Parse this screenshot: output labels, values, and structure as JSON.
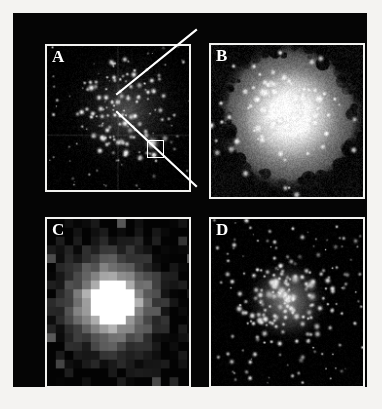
{
  "figure": {
    "kind": "multi-panel-astronomical-image",
    "page_background": "#f4f3f1",
    "mount_background": "#050505",
    "panel_border_color": "#f2f2f0",
    "label_color": "#ffffff",
    "panel_count": 4
  },
  "panels": [
    {
      "id": "a",
      "label": "A",
      "content": "wide-field star cluster",
      "background": "#000000",
      "star_color": "#ffffff",
      "haze_color": "#6a6a6a",
      "style": "starfield",
      "chip_gap": true,
      "star_count": 150,
      "seed": 101
    },
    {
      "id": "b",
      "label": "B",
      "content": "bright resolved nebulous core on mottled gray halo",
      "background": "#8d8d8d",
      "star_color": "#ffffff",
      "haze_color": "#d8d8d8",
      "style": "nebula-halo",
      "chip_gap": false,
      "star_count": 40,
      "seed": 202
    },
    {
      "id": "c",
      "label": "C",
      "content": "low-resolution pixelated blocky image of the core",
      "background": "#030303",
      "star_color": "#ffffff",
      "haze_color": "#808080",
      "style": "pixelated-blocks",
      "chip_gap": false,
      "block_size": 9,
      "seed": 303
    },
    {
      "id": "d",
      "label": "D",
      "content": "high-resolution image resolving individual point sources",
      "background": "#020202",
      "star_color": "#ffffff",
      "haze_color": "#9a9a9a",
      "style": "resolved-points",
      "chip_gap": false,
      "star_count": 130,
      "seed": 404
    }
  ],
  "zoom_box": {
    "name": "zoom-region-indicator",
    "color": "#ffffff",
    "x": 100,
    "y": 94,
    "width": 17,
    "height": 18
  },
  "leader_lines": {
    "name": "zoom-leader-lines",
    "color": "#ffffff",
    "width": 2.2,
    "segments": [
      {
        "from": [
          104,
          81
        ],
        "to": [
          183,
          17
        ]
      },
      {
        "from": [
          104,
          99
        ],
        "to": [
          183,
          173
        ]
      }
    ]
  }
}
